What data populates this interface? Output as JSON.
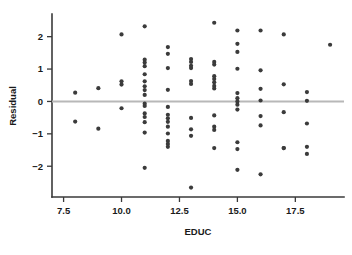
{
  "chart_data": {
    "type": "scatter",
    "title": "",
    "xlabel": "EDUC",
    "ylabel": "Residual",
    "xlim": [
      7.0,
      19.6
    ],
    "ylim": [
      -2.95,
      2.7
    ],
    "grid": false,
    "legend": null,
    "reference_line": {
      "orientation": "horizontal",
      "y": 0,
      "color": "#b8b8b8"
    },
    "xticks": [
      7.5,
      10.0,
      12.5,
      15.0,
      17.5
    ],
    "xtick_labels": [
      "7.5",
      "10.0",
      "12.5",
      "15.0",
      "17.5"
    ],
    "yticks": [
      2,
      1,
      0,
      -1,
      -2
    ],
    "ytick_labels": [
      "2",
      "1",
      "0",
      "−1",
      "−2"
    ],
    "point_color": "#3b3b3b",
    "point_radius": 2.1,
    "x": [
      8,
      8,
      9,
      9,
      10,
      10,
      10,
      10,
      11,
      11,
      11,
      11,
      11,
      11,
      11,
      11,
      11,
      11,
      11,
      11,
      11,
      11,
      11,
      11,
      12,
      12,
      12,
      12,
      12,
      12,
      12,
      12,
      12,
      12,
      12,
      12,
      12,
      13,
      13,
      13,
      13,
      13,
      13,
      13,
      13,
      13,
      14,
      14,
      14,
      14,
      14,
      14,
      14,
      14,
      14,
      14,
      14,
      14,
      15,
      15,
      15,
      15,
      15,
      15,
      15,
      15,
      15,
      15,
      15,
      15,
      16,
      16,
      16,
      16,
      16,
      16,
      16,
      17,
      17,
      17,
      17,
      17,
      18,
      18,
      18,
      18,
      18,
      19
    ],
    "y": [
      0.27,
      -0.62,
      0.41,
      -0.84,
      2.07,
      0.62,
      0.52,
      -0.21,
      2.32,
      1.29,
      1.2,
      1.09,
      0.84,
      0.62,
      0.47,
      0.35,
      0.2,
      -0.07,
      -0.14,
      -0.37,
      -0.48,
      -0.64,
      -0.96,
      -2.05,
      1.68,
      1.47,
      1.03,
      0.36,
      -0.17,
      -0.41,
      -0.52,
      -0.63,
      -0.78,
      -0.99,
      -1.22,
      -1.31,
      -1.4,
      1.31,
      1.22,
      1.1,
      1.03,
      0.63,
      0.54,
      -0.51,
      -0.86,
      -1.06,
      2.43,
      1.22,
      1.14,
      0.78,
      0.69,
      0.59,
      0.48,
      0.4,
      -0.43,
      -0.78,
      -0.88,
      -1.44,
      2.19,
      1.78,
      1.53,
      1.01,
      0.26,
      0.1,
      0.0,
      -0.1,
      -0.25,
      -1.26,
      -1.47,
      -2.11,
      2.19,
      0.96,
      0.39,
      0.03,
      -0.45,
      -0.74,
      -2.25,
      2.07,
      0.53,
      -0.33,
      -1.44,
      -1.44,
      0.29,
      0.02,
      -0.68,
      -1.4,
      -1.62,
      1.75
    ],
    "extra_points": [
      {
        "x": 13,
        "y": -2.66
      }
    ],
    "n_points": 88
  }
}
